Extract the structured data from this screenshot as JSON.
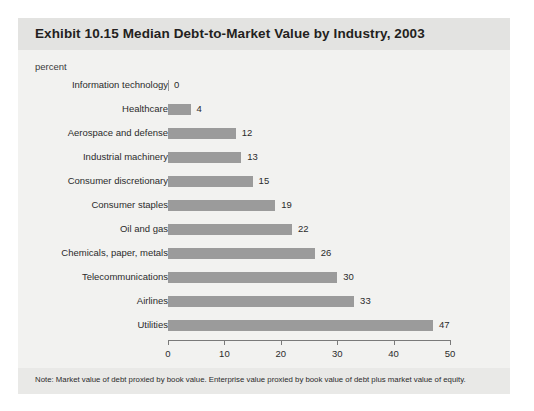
{
  "panel": {
    "title": "Exhibit 10.15 Median Debt-to-Market Value by Industry, 2003",
    "unit_label": "percent",
    "footnote": "Note: Market value of debt proxied by book value. Enterprise value proxied by book value of debt plus market value of equity."
  },
  "colors": {
    "bar": "#9b9b9b",
    "header_band": "#e3e3e1",
    "panel_background": "#f2f2f0",
    "footer_band": "#e9e9e7",
    "axis": "#7a7a7a",
    "text": "#2b2b2b",
    "title_text": "#231f20"
  },
  "chart_data": {
    "type": "bar",
    "orientation": "horizontal",
    "title": "Exhibit 10.15 Median Debt-to-Market Value by Industry, 2003",
    "subtitle": "",
    "xlabel": "percent",
    "ylabel": "",
    "xlim": [
      0,
      50
    ],
    "xticks": [
      0,
      10,
      20,
      30,
      40,
      50
    ],
    "xtick_labels": [
      "0",
      "10",
      "20",
      "30",
      "40",
      "50"
    ],
    "grid": false,
    "legend": false,
    "data_labels": true,
    "categories": [
      "Information technology",
      "Healthcare",
      "Aerospace and defense",
      "Industrial machinery",
      "Consumer discretionary",
      "Consumer staples",
      "Oil and gas",
      "Chemicals, paper, metals",
      "Telecommunications",
      "Airlines",
      "Utilities"
    ],
    "values": [
      0,
      4,
      12,
      13,
      15,
      19,
      22,
      26,
      30,
      33,
      47
    ],
    "value_labels": [
      "0",
      "4",
      "12",
      "13",
      "15",
      "19",
      "22",
      "26",
      "30",
      "33",
      "47"
    ],
    "annotations": [
      "Note: Market value of debt proxied by book value. Enterprise value proxied by book value of debt plus market value of equity."
    ]
  }
}
